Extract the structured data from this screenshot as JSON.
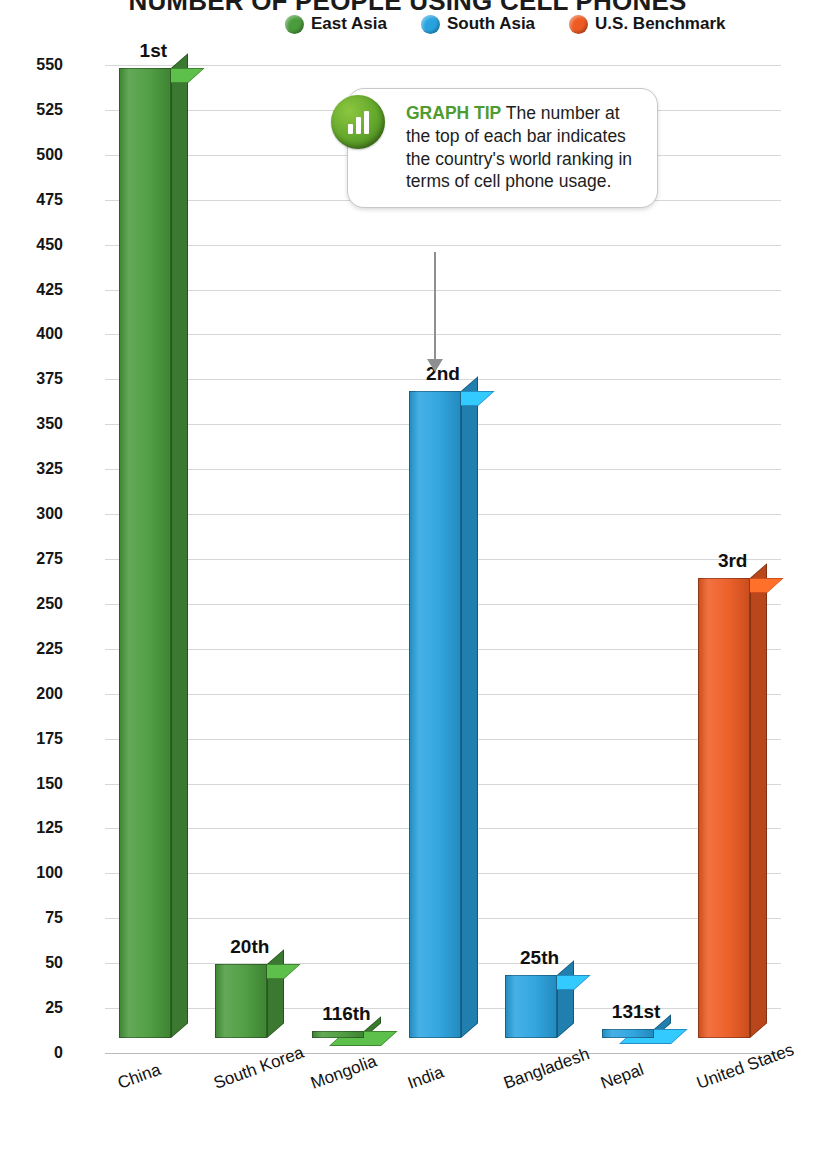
{
  "chart_title": "NUMBER OF PEOPLE USING CELL PHONES",
  "legend": {
    "items": [
      {
        "label": "East Asia",
        "color": "#4a9b3c"
      },
      {
        "label": "South Asia",
        "color": "#29a3e0"
      },
      {
        "label": "U.S. Benchmark",
        "color": "#ee5b22"
      }
    ]
  },
  "tip": {
    "icon_name": "bar-chart-icon",
    "heading": "GRAPH TIP",
    "body": " The number at the top of each bar indicates the country's world ranking in terms of cell phone usage."
  },
  "chart_data": {
    "type": "bar",
    "title": "NUMBER OF PEOPLE USING CELL PHONES",
    "xlabel": "",
    "ylabel": "Number of People in Millions",
    "ylim": [
      0,
      550
    ],
    "ytick_step": 25,
    "yticks": [
      550,
      525,
      500,
      475,
      450,
      425,
      400,
      375,
      350,
      325,
      300,
      275,
      250,
      225,
      200,
      175,
      150,
      125,
      100,
      75,
      50,
      25,
      0
    ],
    "grid": true,
    "legend_position": "top",
    "categories": [
      "China",
      "South Korea",
      "Mongolia",
      "India",
      "Bangladesh",
      "Nepal",
      "United States"
    ],
    "values": [
      540,
      41,
      4,
      360,
      35,
      5,
      256
    ],
    "data_labels": [
      "1st",
      "20th",
      "116th",
      "2nd",
      "25th",
      "131st",
      "3rd"
    ],
    "groups": [
      "East Asia",
      "East Asia",
      "East Asia",
      "South Asia",
      "South Asia",
      "South Asia",
      "U.S. Benchmark"
    ],
    "colors": [
      "#4a9b3c",
      "#4a9b3c",
      "#4a9b3c",
      "#29a3e0",
      "#29a3e0",
      "#29a3e0",
      "#ee5b22"
    ]
  }
}
